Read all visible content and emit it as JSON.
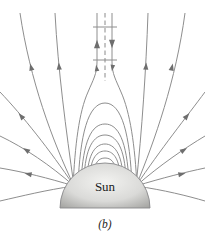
{
  "figure": {
    "sun_label": "Sun",
    "caption": "(b)",
    "colors": {
      "background": "#ffffff",
      "field_line": "#8e8e8e",
      "arrow": "#6e6e6e",
      "current_sheet": "#8a8a8a",
      "sun_fill_light": "#f2f2f0",
      "sun_fill_mid": "#dadad8",
      "sun_fill_dark": "#9e9e9b",
      "sun_outline": "#88888a",
      "text": "#1c1c1c"
    },
    "structure": {
      "closed_loops": 6,
      "open_field_lines_left": 6,
      "open_field_lines_right": 6,
      "crossbars_on_streamer": 2,
      "current_sheet_style": "dashed vertical centerline",
      "left_sheet_arrow_direction": "up",
      "right_sheet_arrow_direction": "down"
    }
  }
}
